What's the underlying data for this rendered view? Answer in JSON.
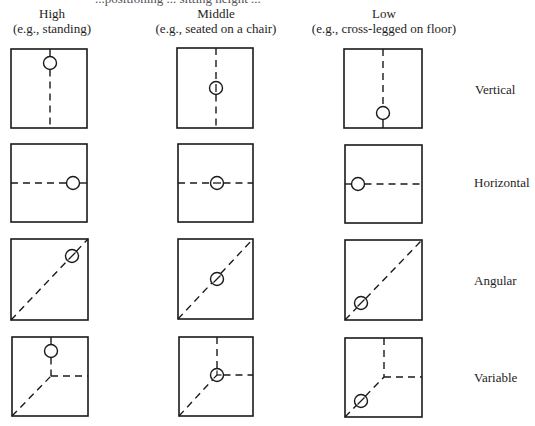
{
  "caption_partial": "...positioning ... sitting height ...",
  "columns": [
    {
      "title": "High",
      "subtitle": "(e.g., standing)",
      "cx": 52
    },
    {
      "title": "Middle",
      "subtitle": "(e.g., seated on a chair)",
      "cx": 216
    },
    {
      "title": "Low",
      "subtitle": "(e.g., cross-legged on floor)",
      "cx": 383
    }
  ],
  "rows": [
    {
      "label": "Vertical",
      "label_y": 89
    },
    {
      "label": "Horizontal",
      "label_y": 182
    },
    {
      "label": "Angular",
      "label_y": 280
    },
    {
      "label": "Variable",
      "label_y": 377
    }
  ],
  "style": {
    "stroke": "#1a1a1a",
    "background": "#ffffff"
  },
  "boxes": [
    {
      "row": 0,
      "col": 0,
      "x": 11,
      "y": 49,
      "w": 76,
      "h": 79,
      "type": "vertical",
      "circle": [
        50,
        63
      ],
      "mark": "none"
    },
    {
      "row": 0,
      "col": 1,
      "x": 177,
      "y": 48,
      "w": 76,
      "h": 80,
      "type": "vertical",
      "circle": [
        216,
        88
      ],
      "mark": "vbar"
    },
    {
      "row": 0,
      "col": 2,
      "x": 344,
      "y": 49,
      "w": 78,
      "h": 79,
      "type": "vertical",
      "circle": [
        383,
        113
      ],
      "mark": "none"
    },
    {
      "row": 1,
      "col": 0,
      "x": 11,
      "y": 144,
      "w": 76,
      "h": 78,
      "type": "horizontal",
      "circle": [
        73,
        183
      ],
      "mark": "none"
    },
    {
      "row": 1,
      "col": 1,
      "x": 178,
      "y": 144,
      "w": 75,
      "h": 78,
      "type": "horizontal",
      "circle": [
        217,
        183
      ],
      "mark": "hbar"
    },
    {
      "row": 1,
      "col": 2,
      "x": 345,
      "y": 145,
      "w": 77,
      "h": 78,
      "type": "horizontal",
      "circle": [
        358,
        184
      ],
      "mark": "none"
    },
    {
      "row": 2,
      "col": 0,
      "x": 11,
      "y": 239,
      "w": 77,
      "h": 81,
      "type": "angular",
      "circle": [
        72,
        256
      ],
      "mark": "slash"
    },
    {
      "row": 2,
      "col": 1,
      "x": 178,
      "y": 239,
      "w": 75,
      "h": 80,
      "type": "angular",
      "circle": [
        217,
        279
      ],
      "mark": "slash"
    },
    {
      "row": 2,
      "col": 2,
      "x": 345,
      "y": 240,
      "w": 77,
      "h": 80,
      "type": "angular",
      "circle": [
        361,
        303
      ],
      "mark": "slash"
    },
    {
      "row": 3,
      "col": 0,
      "x": 12,
      "y": 337,
      "w": 76,
      "h": 79,
      "type": "variable",
      "junction": [
        51,
        376
      ],
      "circle": [
        51,
        351
      ],
      "mark": "none"
    },
    {
      "row": 3,
      "col": 1,
      "x": 179,
      "y": 337,
      "w": 74,
      "h": 79,
      "type": "variable",
      "junction": [
        217,
        375
      ],
      "circle": [
        217,
        375
      ],
      "mark": "tri"
    },
    {
      "row": 3,
      "col": 2,
      "x": 345,
      "y": 338,
      "w": 77,
      "h": 79,
      "type": "variable",
      "junction": [
        384,
        377
      ],
      "circle": [
        361,
        401
      ],
      "mark": "slash"
    }
  ]
}
